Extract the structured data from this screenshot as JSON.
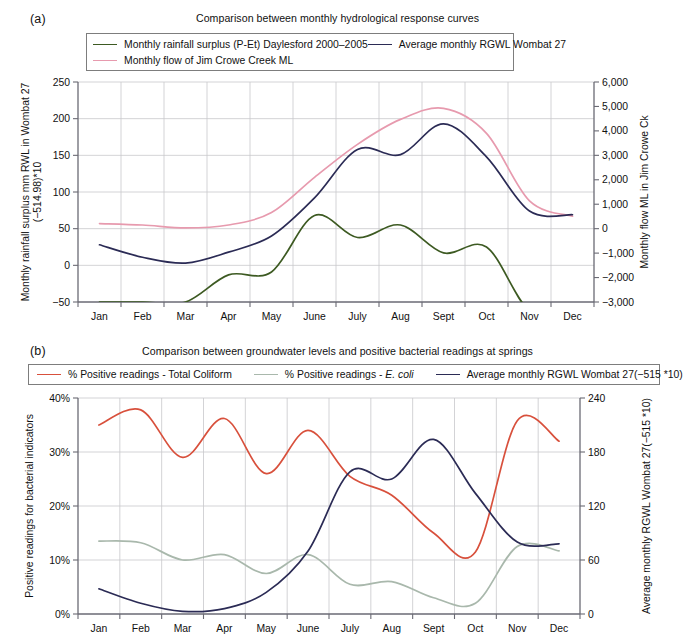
{
  "figure": {
    "panel_a_letter": "(a)",
    "panel_b_letter": "(b)"
  },
  "chart_data": [
    {
      "id": "panel-a",
      "type": "line",
      "title": "Comparison between monthly hydrological response curves",
      "xlabel": "",
      "ylabel": "Monthly rainfall surplus mm RWL in Wombat 27",
      "ylabel_line2": "(−514.98)*10",
      "y2label": "Monthly flow ML in Jim Crowe Ck",
      "categories": [
        "Jan",
        "Feb",
        "Mar",
        "Apr",
        "May",
        "June",
        "July",
        "Aug",
        "Sept",
        "Oct",
        "Nov",
        "Dec"
      ],
      "ylim": [
        -50,
        250
      ],
      "yticks": [
        -50,
        0,
        50,
        100,
        150,
        200,
        250
      ],
      "yticklabels": [
        "−50",
        "0",
        "50",
        "100",
        "150",
        "200",
        "250"
      ],
      "y2lim": [
        -3000,
        6000
      ],
      "y2ticks": [
        -3000,
        -2000,
        -1000,
        0,
        1000,
        2000,
        3000,
        4000,
        5000,
        6000
      ],
      "y2ticklabels": [
        "−3,000",
        "−2,000",
        "−1,000",
        "0",
        "1,000",
        "2,000",
        "3,000",
        "4,000",
        "5,000",
        "6,000"
      ],
      "grid": true,
      "legend_position": "top",
      "series": [
        {
          "name": "Monthly rainfall surplus (P-Et) Daylesford 2000–2005",
          "color": "#3d5a22",
          "axis": "left",
          "values": [
            -50,
            -50,
            -50,
            -13,
            -9,
            68,
            38,
            55,
            17,
            25,
            -62,
            -62
          ]
        },
        {
          "name": "Monthly flow of Jim Crowe Creek ML",
          "color": "#e79aae",
          "axis": "left",
          "values": [
            57,
            55,
            51,
            55,
            72,
            120,
            165,
            199,
            214,
            180,
            88,
            67
          ]
        },
        {
          "name": "Average monthly RGWL Wombat 27",
          "color": "#2b2b55",
          "axis": "left",
          "values": [
            28,
            11,
            3,
            18,
            40,
            92,
            158,
            151,
            193,
            148,
            74,
            69
          ]
        }
      ]
    },
    {
      "id": "panel-b",
      "type": "line",
      "title": "Comparison between groundwater levels and positive bacterial readings at springs",
      "xlabel": "",
      "ylabel": "Positive readings for bacterial indicators",
      "y2label": "Average monthly RGWL Wombat 27(−515 *10)",
      "categories": [
        "Jan",
        "Feb",
        "Mar",
        "Apr",
        "May",
        "June",
        "July",
        "Aug",
        "Sept",
        "Oct",
        "Nov",
        "Dec"
      ],
      "ylim": [
        0,
        40
      ],
      "yticks": [
        0,
        10,
        20,
        30,
        40
      ],
      "yticklabels": [
        "0%",
        "10%",
        "20%",
        "30%",
        "40%"
      ],
      "y2lim": [
        0,
        240
      ],
      "y2ticks": [
        0,
        60,
        120,
        180,
        240
      ],
      "y2ticklabels": [
        "0",
        "60",
        "120",
        "180",
        "240"
      ],
      "grid": true,
      "legend_position": "top",
      "series": [
        {
          "name": "% Positive readings - Total Coliform",
          "color": "#d8503c",
          "axis": "left",
          "values": [
            35.0,
            37.8,
            29.0,
            36.2,
            26.0,
            34.0,
            25.5,
            22.0,
            15.0,
            11.5,
            35.8,
            32.0
          ]
        },
        {
          "name": "% Positive readings - E. coli",
          "color": "#a9b8ac",
          "axis": "left",
          "italic_part": "E. coli",
          "values": [
            13.5,
            13.2,
            10.0,
            11.0,
            7.5,
            11.0,
            5.5,
            6.0,
            3.0,
            2.0,
            12.5,
            11.7
          ]
        },
        {
          "name": "Average monthly RGWL Wombat 27(−515 *10)",
          "color": "#2b2b55",
          "axis": "right",
          "values": [
            28,
            12,
            3,
            6,
            24,
            70,
            158,
            150,
            194,
            134,
            80,
            78
          ]
        }
      ]
    }
  ]
}
